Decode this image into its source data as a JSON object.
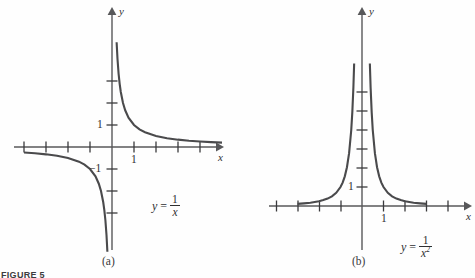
{
  "figure": {
    "caption": "FIGURE 5",
    "panels": [
      {
        "key": "a",
        "label": "(a)",
        "equation": {
          "lhs": "y",
          "eq": "=",
          "numerator": "1",
          "denominator": "x",
          "exponent": ""
        },
        "axis_labels": {
          "x": "x",
          "y": "y"
        },
        "tick_labels": {
          "x_one": "1",
          "y_one": "1",
          "y_neg_one": "−1"
        }
      },
      {
        "key": "b",
        "label": "(b)",
        "equation": {
          "lhs": "y",
          "eq": "=",
          "numerator": "1",
          "denominator": "x",
          "exponent": "2"
        },
        "axis_labels": {
          "x": "x",
          "y": "y"
        },
        "tick_labels": {
          "x_one": "1",
          "y_one": "1"
        }
      }
    ]
  },
  "chart_data": [
    {
      "type": "line",
      "title": "y = 1/x",
      "panel": "(a)",
      "function": "y = 1/x",
      "xlabel": "x",
      "ylabel": "y",
      "xlim": [
        -4.1,
        5.1
      ],
      "ylim": [
        -4.8,
        4.8
      ],
      "grid": false,
      "legend": "none",
      "x_ticks": [
        -4,
        -3,
        -2,
        -1,
        1,
        2,
        3,
        4
      ],
      "y_ticks": [
        -3,
        -2,
        -1,
        1,
        2,
        3
      ],
      "x_tick_labels_shown": {
        "1": "1"
      },
      "y_tick_labels_shown": {
        "1": "1",
        "-1": "−1"
      },
      "unit_px": {
        "x": 22,
        "y": 22
      },
      "origin_px": {
        "x": 112,
        "y": 147
      },
      "branches": [
        {
          "name": "positive branch",
          "domain": [
            0.21,
            5.0
          ],
          "points": [
            [
              0.21,
              4.76
            ],
            [
              0.25,
              4.0
            ],
            [
              0.3,
              3.33
            ],
            [
              0.35,
              2.86
            ],
            [
              0.4,
              2.5
            ],
            [
              0.5,
              2.0
            ],
            [
              0.6,
              1.67
            ],
            [
              0.75,
              1.33
            ],
            [
              1.0,
              1.0
            ],
            [
              1.25,
              0.8
            ],
            [
              1.5,
              0.67
            ],
            [
              2.0,
              0.5
            ],
            [
              2.5,
              0.4
            ],
            [
              3.0,
              0.333
            ],
            [
              3.5,
              0.286
            ],
            [
              4.0,
              0.25
            ],
            [
              4.5,
              0.222
            ],
            [
              5.0,
              0.2
            ]
          ]
        },
        {
          "name": "negative branch",
          "domain": [
            -4.0,
            -0.21
          ],
          "points": [
            [
              -4.0,
              -0.25
            ],
            [
              -3.5,
              -0.286
            ],
            [
              -3.0,
              -0.333
            ],
            [
              -2.5,
              -0.4
            ],
            [
              -2.0,
              -0.5
            ],
            [
              -1.5,
              -0.667
            ],
            [
              -1.25,
              -0.8
            ],
            [
              -1.0,
              -1.0
            ],
            [
              -0.75,
              -1.33
            ],
            [
              -0.6,
              -1.67
            ],
            [
              -0.5,
              -2.0
            ],
            [
              -0.4,
              -2.5
            ],
            [
              -0.35,
              -2.86
            ],
            [
              -0.3,
              -3.33
            ],
            [
              -0.25,
              -4.0
            ],
            [
              -0.21,
              -4.76
            ]
          ]
        }
      ]
    },
    {
      "type": "line",
      "title": "y = 1/x^2",
      "panel": "(b)",
      "function": "y = 1/x²",
      "xlabel": "x",
      "ylabel": "y",
      "xlim": [
        -3.2,
        4.2
      ],
      "ylim": [
        -0.7,
        8.2
      ],
      "grid": false,
      "legend": "none",
      "x_ticks": [
        -3,
        -2,
        -1,
        1,
        2,
        3,
        4
      ],
      "y_ticks": [
        1,
        2,
        3,
        4,
        5,
        6
      ],
      "x_tick_labels_shown": {
        "1": "1"
      },
      "y_tick_labels_shown": {
        "1": "1"
      },
      "unit_px": {
        "x": 21.5,
        "y": 19
      },
      "origin_px": {
        "x": 362,
        "y": 206
      },
      "branches": [
        {
          "name": "right branch",
          "domain": [
            0.365,
            3.0
          ],
          "points": [
            [
              0.365,
              7.5
            ],
            [
              0.4,
              6.25
            ],
            [
              0.45,
              4.94
            ],
            [
              0.5,
              4.0
            ],
            [
              0.6,
              2.78
            ],
            [
              0.7,
              2.04
            ],
            [
              0.8,
              1.56
            ],
            [
              0.9,
              1.23
            ],
            [
              1.0,
              1.0
            ],
            [
              1.2,
              0.69
            ],
            [
              1.4,
              0.51
            ],
            [
              1.6,
              0.39
            ],
            [
              1.8,
              0.31
            ],
            [
              2.0,
              0.25
            ],
            [
              2.4,
              0.17
            ],
            [
              2.7,
              0.14
            ],
            [
              3.0,
              0.11
            ]
          ]
        },
        {
          "name": "left branch",
          "domain": [
            -3.0,
            -0.365
          ],
          "points": [
            [
              -3.0,
              0.11
            ],
            [
              -2.7,
              0.14
            ],
            [
              -2.4,
              0.17
            ],
            [
              -2.0,
              0.25
            ],
            [
              -1.8,
              0.31
            ],
            [
              -1.6,
              0.39
            ],
            [
              -1.4,
              0.51
            ],
            [
              -1.2,
              0.69
            ],
            [
              -1.0,
              1.0
            ],
            [
              -0.9,
              1.23
            ],
            [
              -0.8,
              1.56
            ],
            [
              -0.7,
              2.04
            ],
            [
              -0.6,
              2.78
            ],
            [
              -0.5,
              4.0
            ],
            [
              -0.45,
              4.94
            ],
            [
              -0.4,
              6.25
            ],
            [
              -0.365,
              7.5
            ]
          ]
        }
      ]
    }
  ]
}
